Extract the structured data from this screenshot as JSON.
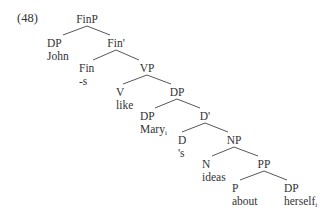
{
  "example": {
    "number": "(48)"
  },
  "tree": {
    "nodes": [
      {
        "id": "FinP",
        "category": "FinP",
        "word": "",
        "x": 87,
        "y": 13,
        "align": "center"
      },
      {
        "id": "DP-John",
        "category": "DP",
        "word": "John",
        "x": 47,
        "y": 37,
        "align": "left"
      },
      {
        "id": "FinBar",
        "category": "Fin'",
        "word": "",
        "x": 116,
        "y": 37,
        "align": "center"
      },
      {
        "id": "Fin",
        "category": "Fin",
        "word": "-s",
        "x": 79,
        "y": 62,
        "align": "left"
      },
      {
        "id": "VP",
        "category": "VP",
        "word": "",
        "x": 147,
        "y": 62,
        "align": "center"
      },
      {
        "id": "V",
        "category": "V",
        "word": "like",
        "x": 116,
        "y": 86,
        "align": "left"
      },
      {
        "id": "DP-top",
        "category": "DP",
        "word": "",
        "x": 177,
        "y": 86,
        "align": "center"
      },
      {
        "id": "DP-Mary",
        "category": "DP",
        "word": "Mary",
        "subscript": "i",
        "x": 140,
        "y": 110,
        "align": "left"
      },
      {
        "id": "DBar",
        "category": "D'",
        "word": "",
        "x": 205,
        "y": 110,
        "align": "center"
      },
      {
        "id": "D",
        "category": "D",
        "word": "'s",
        "x": 178,
        "y": 134,
        "align": "left"
      },
      {
        "id": "NP",
        "category": "NP",
        "word": "",
        "x": 234,
        "y": 134,
        "align": "center"
      },
      {
        "id": "N",
        "category": "N",
        "word": "ideas",
        "x": 202,
        "y": 158,
        "align": "left"
      },
      {
        "id": "PP",
        "category": "PP",
        "word": "",
        "x": 264,
        "y": 158,
        "align": "center"
      },
      {
        "id": "P",
        "category": "P",
        "word": "about",
        "x": 232,
        "y": 182,
        "align": "left"
      },
      {
        "id": "DP-herself",
        "category": "DP",
        "word": "herself",
        "subscript": "i",
        "x": 284,
        "y": 182,
        "align": "left"
      }
    ],
    "edges": [
      {
        "from": "FinP",
        "to": "DP-John",
        "x1": 87,
        "y1": 26,
        "x2": 63,
        "y2": 35
      },
      {
        "from": "FinP",
        "to": "FinBar",
        "x1": 87,
        "y1": 26,
        "x2": 110,
        "y2": 35
      },
      {
        "from": "FinBar",
        "to": "Fin",
        "x1": 116,
        "y1": 50,
        "x2": 93,
        "y2": 60
      },
      {
        "from": "FinBar",
        "to": "VP",
        "x1": 116,
        "y1": 50,
        "x2": 139,
        "y2": 60
      },
      {
        "from": "VP",
        "to": "V",
        "x1": 147,
        "y1": 75,
        "x2": 123,
        "y2": 84
      },
      {
        "from": "VP",
        "to": "DP-top",
        "x1": 147,
        "y1": 75,
        "x2": 171,
        "y2": 84
      },
      {
        "from": "DP-top",
        "to": "DP-Mary",
        "x1": 177,
        "y1": 99,
        "x2": 155,
        "y2": 108
      },
      {
        "from": "DP-top",
        "to": "DBar",
        "x1": 177,
        "y1": 99,
        "x2": 200,
        "y2": 108
      },
      {
        "from": "DBar",
        "to": "D",
        "x1": 205,
        "y1": 123,
        "x2": 182,
        "y2": 132
      },
      {
        "from": "DBar",
        "to": "NP",
        "x1": 205,
        "y1": 123,
        "x2": 228,
        "y2": 132
      },
      {
        "from": "NP",
        "to": "N",
        "x1": 234,
        "y1": 147,
        "x2": 212,
        "y2": 156
      },
      {
        "from": "NP",
        "to": "PP",
        "x1": 234,
        "y1": 147,
        "x2": 258,
        "y2": 156
      },
      {
        "from": "PP",
        "to": "P",
        "x1": 264,
        "y1": 171,
        "x2": 240,
        "y2": 180
      },
      {
        "from": "PP",
        "to": "DP-herself",
        "x1": 264,
        "y1": 171,
        "x2": 287,
        "y2": 180
      }
    ]
  },
  "colors": {
    "text": "#333333",
    "line": "#444444",
    "background": "#ffffff"
  }
}
